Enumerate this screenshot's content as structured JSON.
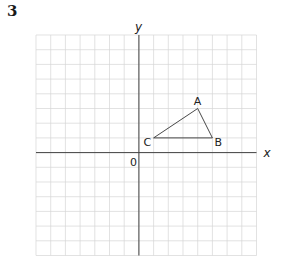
{
  "question_number": "3",
  "diagram": {
    "type": "coordinate-grid",
    "x_axis_label": "x",
    "y_axis_label": "y",
    "origin_label": "0",
    "grid": {
      "x_min": -7,
      "x_max": 8,
      "y_min": -7,
      "y_max": 8
    },
    "shape": {
      "name": "triangle ABC",
      "vertices": [
        {
          "label": "A",
          "x": 4,
          "y": 3
        },
        {
          "label": "B",
          "x": 5,
          "y": 1
        },
        {
          "label": "C",
          "x": 1,
          "y": 1
        }
      ]
    },
    "colors": {
      "grid": "#d6d6d6",
      "axis": "#444444",
      "shape": "#333333"
    }
  }
}
